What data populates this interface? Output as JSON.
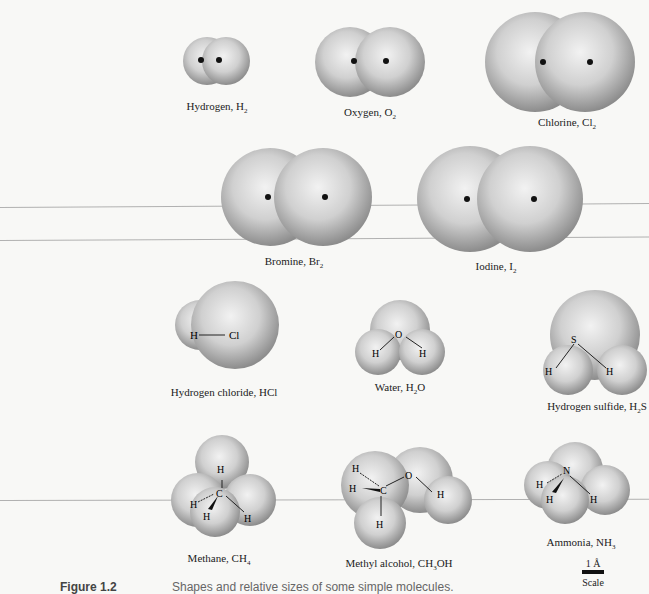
{
  "figure": {
    "number_label": "Figure 1.2",
    "caption": "Shapes and relative sizes of some simple molecules."
  },
  "molecules": [
    {
      "name": "Hydrogen, H",
      "sub": "2"
    },
    {
      "name": "Oxygen, O",
      "sub": "2"
    },
    {
      "name": "Chlorine, Cl",
      "sub": "2"
    },
    {
      "name": "Bromine, Br",
      "sub": "2"
    },
    {
      "name": "Iodine, I",
      "sub": "2"
    },
    {
      "name": "Hydrogen chloride, HCl",
      "sub": ""
    },
    {
      "name": "Water, H",
      "sub": "2",
      "tail": "O"
    },
    {
      "name": "Hydrogen sulfide, H",
      "sub": "2",
      "tail": "S"
    },
    {
      "name": "Methane, CH",
      "sub": "4"
    },
    {
      "name": "Methyl alcohol, CH",
      "sub": "3",
      "tail": "OH"
    },
    {
      "name": "Ammonia, NH",
      "sub": "3"
    }
  ],
  "atom_labels": {
    "hcl": [
      "H",
      "Cl"
    ],
    "water": [
      "O",
      "H",
      "H"
    ],
    "h2s": [
      "S",
      "H",
      "H"
    ],
    "methane": [
      "H",
      "C",
      "H",
      "H",
      "H"
    ],
    "methanol": [
      "H",
      "H",
      "C",
      "O",
      "H",
      "H"
    ],
    "ammonia": [
      "N",
      "H",
      "H",
      "H"
    ]
  },
  "scale": {
    "value": "1 Å",
    "label": "Scale"
  }
}
